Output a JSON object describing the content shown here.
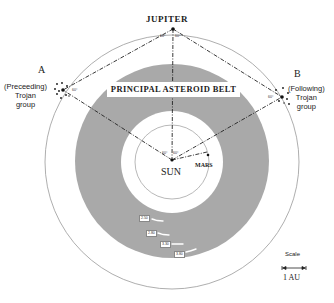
{
  "diagram": {
    "title_banner": "PRINCIPAL ASTEROID BELT",
    "bodies": {
      "jupiter": "JUPITER",
      "sun": "SUN",
      "mars": "MARS"
    },
    "trojan_groups": {
      "a": {
        "letter": "A",
        "line1": "(Preceeding)",
        "line2": "Trojan",
        "line3": "group",
        "angle": "60°"
      },
      "b": {
        "letter": "B",
        "line1": "(Following)",
        "line2": "Trojan",
        "line3": "group",
        "angle": "60°"
      }
    },
    "angles": {
      "jupiter_left": "60°",
      "jupiter_right": "60°",
      "sun_left": "60°",
      "sun_right": "60°"
    },
    "kirkwood_gaps": [
      "2.50",
      "2.80",
      "3.30",
      "3.80"
    ],
    "scale": {
      "title": "Scale",
      "unit": "1 AU"
    },
    "colors": {
      "belt": "#a9a9a9",
      "lines": "#222222",
      "orbit": "#888888"
    }
  }
}
